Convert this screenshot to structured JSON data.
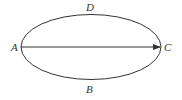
{
  "diagram": {
    "shape": "ellipse",
    "ellipse": {
      "cx": 91,
      "cy": 47,
      "rx": 70,
      "ry": 32.5,
      "stroke": "#333333"
    },
    "arrow": {
      "from": "A",
      "to": "C",
      "x1": 21,
      "y1": 47,
      "x2": 160,
      "y2": 47,
      "stroke": "#333333"
    },
    "labels": {
      "A": "A",
      "B": "B",
      "C": "C",
      "D": "D"
    }
  }
}
